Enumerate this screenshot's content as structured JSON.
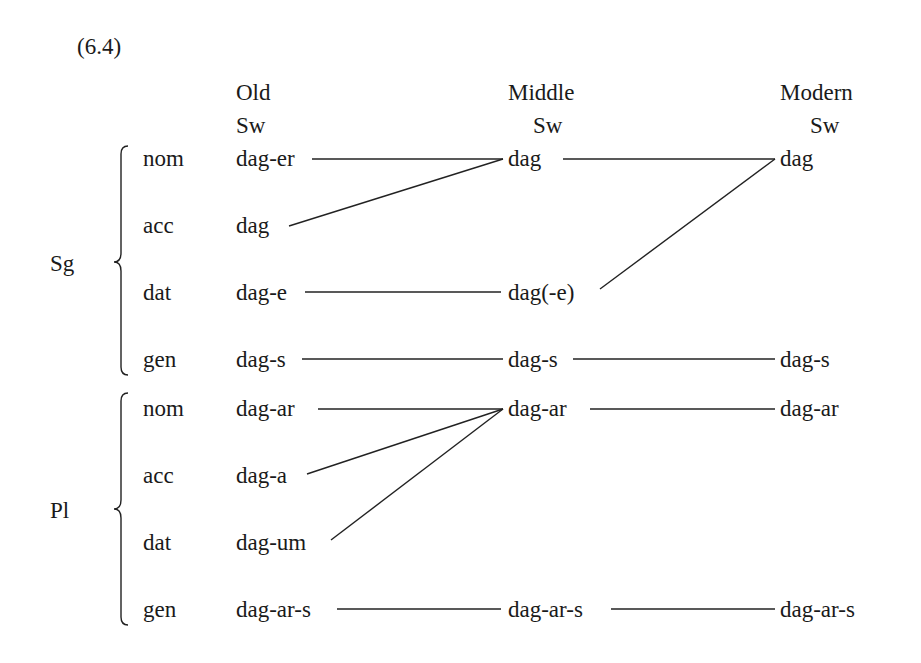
{
  "example_number": "(6.4)",
  "columns": [
    {
      "id": "old",
      "line1": "Old",
      "line2": "Sw"
    },
    {
      "id": "middle",
      "line1": "Middle",
      "line2": "Sw"
    },
    {
      "id": "modern",
      "line1": "Modern",
      "line2": "Sw"
    }
  ],
  "groups": [
    {
      "label": "Sg",
      "rows": [
        {
          "case": "nom",
          "old": "dag-er",
          "middle": "dag",
          "modern": "dag"
        },
        {
          "case": "acc",
          "old": "dag",
          "middle": "",
          "modern": ""
        },
        {
          "case": "dat",
          "old": "dag-e",
          "middle": "dag(-e)",
          "modern": ""
        },
        {
          "case": "gen",
          "old": "dag-s",
          "middle": "dag-s",
          "modern": "dag-s"
        }
      ]
    },
    {
      "label": "Pl",
      "rows": [
        {
          "case": "nom",
          "old": "dag-ar",
          "middle": "dag-ar",
          "modern": "dag-ar"
        },
        {
          "case": "acc",
          "old": "dag-a",
          "middle": "",
          "modern": ""
        },
        {
          "case": "dat",
          "old": "dag-um",
          "middle": "",
          "modern": ""
        },
        {
          "case": "gen",
          "old": "dag-ar-s",
          "middle": "dag-ar-s",
          "modern": "dag-ar-s"
        }
      ]
    }
  ],
  "connections": [
    {
      "from": "Sg.nom.old",
      "to": "Sg.nom.middle"
    },
    {
      "from": "Sg.acc.old",
      "to": "Sg.nom.middle"
    },
    {
      "from": "Sg.dat.old",
      "to": "Sg.dat.middle"
    },
    {
      "from": "Sg.gen.old",
      "to": "Sg.gen.middle"
    },
    {
      "from": "Sg.nom.middle",
      "to": "Sg.nom.modern"
    },
    {
      "from": "Sg.dat.middle",
      "to": "Sg.nom.modern"
    },
    {
      "from": "Sg.gen.middle",
      "to": "Sg.gen.modern"
    },
    {
      "from": "Pl.nom.old",
      "to": "Pl.nom.middle"
    },
    {
      "from": "Pl.acc.old",
      "to": "Pl.nom.middle"
    },
    {
      "from": "Pl.dat.old",
      "to": "Pl.nom.middle"
    },
    {
      "from": "Pl.gen.old",
      "to": "Pl.gen.middle"
    },
    {
      "from": "Pl.nom.middle",
      "to": "Pl.nom.modern"
    },
    {
      "from": "Pl.gen.middle",
      "to": "Pl.gen.modern"
    }
  ]
}
